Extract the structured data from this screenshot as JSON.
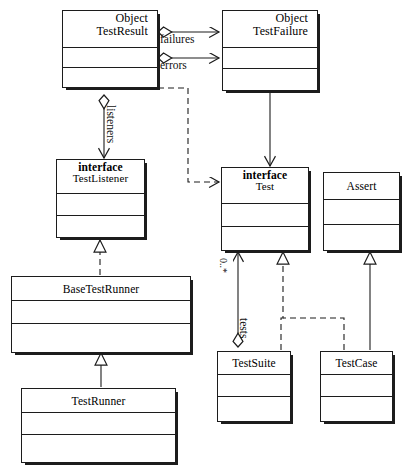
{
  "diagram": {
    "type": "uml-class-diagram",
    "background_color": "#ffffff",
    "line_color": "#1c1c1c"
  },
  "classes": [
    {
      "id": "test-result",
      "stereotype": "Object",
      "name": "TestResult",
      "header_align": "right",
      "attributes": "",
      "operations": ""
    },
    {
      "id": "test-failure",
      "stereotype": "Object",
      "name": "TestFailure",
      "header_align": "right",
      "attributes": "",
      "operations": ""
    },
    {
      "id": "test-listener",
      "stereotype": "interface",
      "name": "TestListener",
      "header_align": "center",
      "attributes": "",
      "operations": ""
    },
    {
      "id": "test",
      "stereotype": "interface",
      "name": "Test",
      "header_align": "center",
      "attributes": "",
      "operations": ""
    },
    {
      "id": "assert",
      "stereotype": "",
      "name": "Assert",
      "header_align": "center",
      "attributes": "",
      "operations": ""
    },
    {
      "id": "base-test-runner",
      "stereotype": "",
      "name": "BaseTestRunner",
      "header_align": "center",
      "attributes": "",
      "operations": ""
    },
    {
      "id": "test-runner",
      "stereotype": "",
      "name": "TestRunner",
      "header_align": "center",
      "attributes": "",
      "operations": ""
    },
    {
      "id": "test-suite",
      "stereotype": "",
      "name": "TestSuite",
      "header_align": "center",
      "attributes": "",
      "operations": ""
    },
    {
      "id": "test-case",
      "stereotype": "",
      "name": "TestCase",
      "header_align": "center",
      "attributes": "",
      "operations": ""
    }
  ],
  "relationships": [
    {
      "id": "failures",
      "from": "test-result",
      "to": "test-failure",
      "kind": "aggregation",
      "label": "failures",
      "multiplicity": ""
    },
    {
      "id": "errors",
      "from": "test-result",
      "to": "test-failure",
      "kind": "aggregation",
      "label": "errors",
      "multiplicity": ""
    },
    {
      "id": "listeners",
      "from": "test-result",
      "to": "test-listener",
      "kind": "aggregation",
      "label": "listeners",
      "multiplicity": ""
    },
    {
      "id": "result-uses-test",
      "from": "test-result",
      "to": "test",
      "kind": "dependency",
      "label": "",
      "multiplicity": ""
    },
    {
      "id": "failure-to-test",
      "from": "test-failure",
      "to": "test",
      "kind": "association",
      "label": "",
      "multiplicity": ""
    },
    {
      "id": "basetestrunner-implements-testlistener",
      "from": "base-test-runner",
      "to": "test-listener",
      "kind": "realization",
      "label": "",
      "multiplicity": ""
    },
    {
      "id": "testrunner-extends-basetestrunner",
      "from": "test-runner",
      "to": "base-test-runner",
      "kind": "generalization",
      "label": "",
      "multiplicity": ""
    },
    {
      "id": "tests",
      "from": "test-suite",
      "to": "test",
      "kind": "aggregation",
      "label": "tests",
      "multiplicity": "0..*"
    },
    {
      "id": "testsuite-implements-test",
      "from": "test-suite",
      "to": "test",
      "kind": "realization",
      "label": "",
      "multiplicity": ""
    },
    {
      "id": "testcase-implements-test",
      "from": "test-case",
      "to": "test",
      "kind": "realization",
      "label": "",
      "multiplicity": ""
    },
    {
      "id": "testcase-extends-assert",
      "from": "test-case",
      "to": "assert",
      "kind": "generalization",
      "label": "",
      "multiplicity": ""
    }
  ],
  "labels": {
    "failures": "failures",
    "errors": "errors",
    "listeners": "listeners",
    "tests": "tests",
    "suite_multiplicity": "0..*"
  }
}
